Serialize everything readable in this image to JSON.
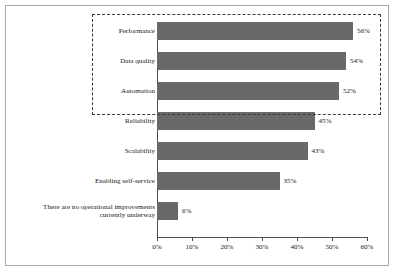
{
  "chart_data": {
    "type": "bar",
    "orientation": "horizontal",
    "title": "",
    "xlabel": "",
    "ylabel": "",
    "categories": [
      "Performance",
      "Data quality",
      "Automation",
      "Reliability",
      "Scalability",
      "Enabling self-service",
      "There are no operational improvements\ncurrently underway"
    ],
    "values": [
      56,
      54,
      52,
      45,
      43,
      35,
      6
    ],
    "value_labels": [
      "56%",
      "54%",
      "52%",
      "45%",
      "43%",
      "35%",
      "6%"
    ],
    "xlim": [
      0,
      60
    ],
    "xticks": [
      0,
      10,
      20,
      30,
      40,
      50,
      60
    ],
    "xtick_labels": [
      "0%",
      "10%",
      "20%",
      "30%",
      "40%",
      "50%",
      "60%"
    ],
    "grid": false,
    "legend": null,
    "bar_color": "#696969",
    "annotations": [
      {
        "type": "dashed-highlight-box",
        "covers_categories": [
          "Performance",
          "Data quality",
          "Automation"
        ],
        "style": "dashed",
        "color": "#3a3a3a"
      }
    ]
  },
  "frame": {
    "border_color": "#a8a8a8"
  }
}
